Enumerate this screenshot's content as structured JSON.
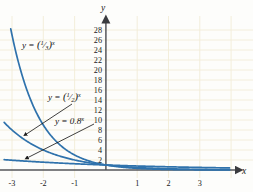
{
  "figure": {
    "kind": "coordinate-graph",
    "background": "#fdfdfb",
    "grid_color": "#f4efdc",
    "axis_color": "#55565a",
    "curve_color": "#2f72ac",
    "text_color": "#1a1a1a"
  },
  "axes": {
    "x_name": "x",
    "y_name": "y",
    "x_ticks": [
      "-3",
      "-2",
      "-1",
      "1",
      "2",
      "3"
    ],
    "y_ticks": [
      "28",
      "26",
      "24",
      "22",
      "20",
      "18",
      "16",
      "14",
      "12",
      "10",
      "8",
      "6",
      "4",
      "2"
    ]
  },
  "labels": {
    "curve1": {
      "lhs": "y =",
      "paren_open": "(",
      "num": "1",
      "den": "3",
      "paren_close": ")",
      "exp": "x",
      "full": "y = (1/3)^x"
    },
    "curve2": {
      "lhs": "y =",
      "paren_open": "(",
      "num": "1",
      "den": "2",
      "paren_close": ")",
      "exp": "x",
      "full": "y = (1/2)^x"
    },
    "curve3": {
      "lhs": "y = 0.8",
      "exp": "x",
      "full": "y = 0.8^x"
    }
  },
  "chart_data": {
    "type": "line",
    "title": "",
    "xlabel": "x",
    "ylabel": "y",
    "xlim": [
      -3.2,
      3.9
    ],
    "ylim": [
      0,
      29
    ],
    "grid": true,
    "legend": "inline-annotations",
    "x": [
      -3,
      -2.5,
      -2,
      -1.5,
      -1,
      -0.5,
      0,
      0.5,
      1,
      1.5,
      2,
      2.5,
      3,
      3.5
    ],
    "series": [
      {
        "name": "y = (1/3)^x",
        "base": 0.3333333,
        "color": "#2f72ac",
        "values": [
          27,
          15.588,
          9,
          5.196,
          3,
          1.732,
          1,
          0.577,
          0.333,
          0.192,
          0.111,
          0.064,
          0.037,
          0.021
        ]
      },
      {
        "name": "y = (1/2)^x",
        "base": 0.5,
        "color": "#2f72ac",
        "values": [
          8,
          5.657,
          4,
          2.828,
          2,
          1.414,
          1,
          0.707,
          0.5,
          0.354,
          0.25,
          0.177,
          0.125,
          0.088
        ]
      },
      {
        "name": "y = 0.8^x",
        "base": 0.8,
        "color": "#2f72ac",
        "values": [
          1.953,
          1.747,
          1.563,
          1.398,
          1.25,
          1.118,
          1,
          0.894,
          0.8,
          0.716,
          0.64,
          0.572,
          0.512,
          0.458
        ]
      }
    ],
    "annotations": [
      {
        "text": "y = (1/3)^x",
        "at_x": -2.3,
        "at_y": 23.5,
        "arrow": false
      },
      {
        "text": "y = (1/2)^x",
        "at_x": -1.55,
        "at_y": 15.2,
        "arrow": true,
        "points_to_x": -2.75,
        "points_to_y": 7.2
      },
      {
        "text": "y = 0.8^x",
        "at_x": -0.85,
        "at_y": 10.4,
        "arrow": true,
        "points_to_x": -2.7,
        "points_to_y": 2.4
      }
    ]
  }
}
